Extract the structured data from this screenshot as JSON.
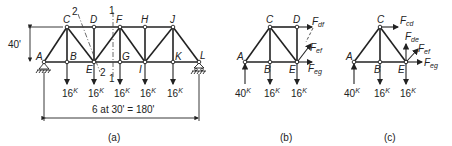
{
  "figure": {
    "panels": [
      {
        "id": "a",
        "caption": "(a)",
        "height_label": "40'",
        "span_label": "6 at 30' = 180'",
        "nodes": {
          "A": "A",
          "B": "B",
          "C": "C",
          "D": "D",
          "E": "E",
          "F": "F",
          "G": "G",
          "H": "H",
          "I": "I",
          "J": "J",
          "K": "K",
          "L": "L"
        },
        "section_labels": {
          "s2_top": "2",
          "s2_bot": "2",
          "s1_top": "1",
          "s1_bot": "1"
        },
        "loads": [
          "16K",
          "16K",
          "16K",
          "16K",
          "16K"
        ],
        "load_value": "16",
        "load_unit": "K"
      },
      {
        "id": "b",
        "caption": "(b)",
        "nodes": {
          "A": "A",
          "B": "B",
          "C": "C",
          "D": "D",
          "E": "E"
        },
        "reaction_value": "40",
        "reaction_unit": "K",
        "load_value": "16",
        "load_unit": "K",
        "forces": [
          {
            "main": "F",
            "sub": "df"
          },
          {
            "main": "F",
            "sub": "ef"
          },
          {
            "main": "F",
            "sub": "eg"
          }
        ]
      },
      {
        "id": "c",
        "caption": "(c)",
        "nodes": {
          "A": "A",
          "B": "B",
          "C": "C",
          "E": "E"
        },
        "reaction_value": "40",
        "reaction_unit": "K",
        "load_value": "16",
        "load_unit": "K",
        "forces": [
          {
            "main": "F",
            "sub": "cd"
          },
          {
            "main": "F",
            "sub": "de"
          },
          {
            "main": "F",
            "sub": "ef"
          },
          {
            "main": "F",
            "sub": "eg"
          }
        ]
      }
    ]
  }
}
